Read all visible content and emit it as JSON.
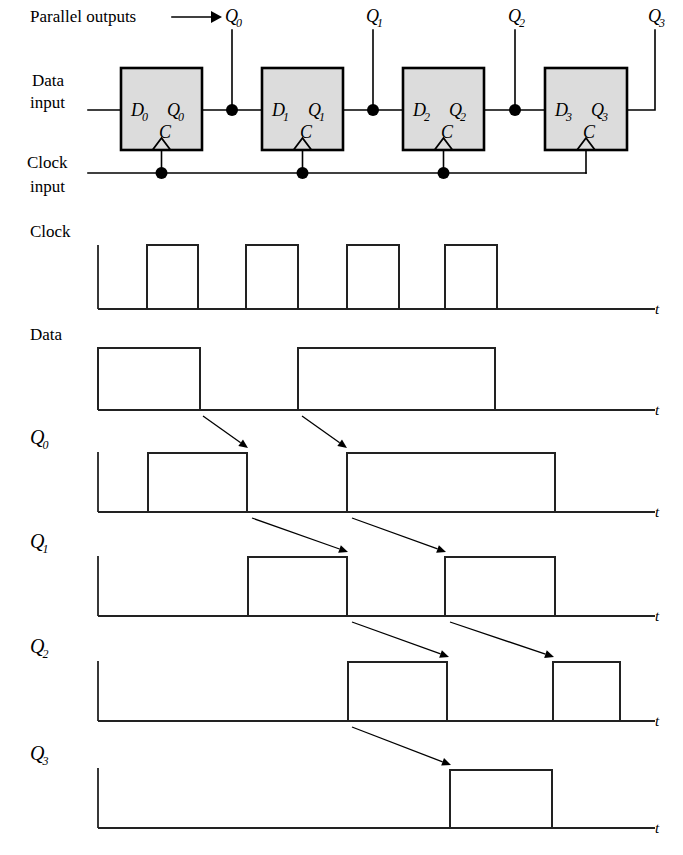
{
  "figure": {
    "background": "#ffffff",
    "ink": "#000000",
    "box_fill": "#dcdcdc"
  },
  "circuit": {
    "labels": {
      "parallel_outputs": "Parallel outputs",
      "data_input_line1": "Data",
      "data_input_line2": "input",
      "clock_input_line1": "Clock",
      "clock_input_line2": "input"
    },
    "arrow_marker": "→",
    "flipflops": [
      {
        "name": "flipflop-0",
        "x": 121,
        "y": 68,
        "w": 81,
        "h": 82,
        "d_label": "D",
        "d_sub": "0",
        "q_label": "Q",
        "q_sub": "0",
        "c_label": "C",
        "out_node_x": 232,
        "out_name": "Q",
        "out_sub": "0"
      },
      {
        "name": "flipflop-1",
        "x": 262,
        "y": 68,
        "w": 81,
        "h": 82,
        "d_label": "D",
        "d_sub": "1",
        "q_label": "Q",
        "q_sub": "1",
        "c_label": "C",
        "out_node_x": 373,
        "out_name": "Q",
        "out_sub": "1"
      },
      {
        "name": "flipflop-2",
        "x": 403,
        "y": 68,
        "w": 81,
        "h": 82,
        "d_label": "D",
        "d_sub": "2",
        "q_label": "Q",
        "q_sub": "2",
        "c_label": "C",
        "out_node_x": 515,
        "out_name": "Q",
        "out_sub": "2"
      },
      {
        "name": "flipflop-3",
        "x": 545,
        "y": 68,
        "w": 82,
        "h": 82,
        "d_label": "D",
        "d_sub": "3",
        "q_label": "Q",
        "q_sub": "3",
        "c_label": "C",
        "out_node_x": 655,
        "out_name": "Q",
        "out_sub": "3"
      }
    ],
    "output_tap_labels": [
      {
        "text": "Q",
        "sub": "0",
        "x": 225,
        "y": 22
      },
      {
        "text": "Q",
        "sub": "1",
        "x": 366,
        "y": 22
      },
      {
        "text": "Q",
        "sub": "2",
        "x": 508,
        "y": 22
      },
      {
        "text": "Q",
        "sub": "3",
        "x": 648,
        "y": 22
      }
    ],
    "data_line_y": 110,
    "clock_bus_y": 173,
    "clock_dots_x": [
      162,
      303,
      444
    ],
    "clock_stub_x": 586
  },
  "timing": {
    "axis_left_x": 98,
    "axis_right_x": 655,
    "t_label": "t",
    "waveforms": [
      {
        "name": "clock",
        "label": "Clock",
        "label_sub": "",
        "baseline_y": 309,
        "high_y": 245,
        "label_x": 30,
        "label_y": 237,
        "pulses": [
          [
            147,
            198
          ],
          [
            246,
            298
          ],
          [
            347,
            399
          ],
          [
            445,
            497
          ]
        ],
        "tail_to": 655
      },
      {
        "name": "data",
        "label": "Data",
        "label_sub": "",
        "baseline_y": 410,
        "high_y": 348,
        "label_x": 30,
        "label_y": 340,
        "pulses": [
          [
            98,
            200
          ],
          [
            298,
            495
          ]
        ],
        "tail_to": 655
      },
      {
        "name": "q0",
        "label": "Q",
        "label_sub": "0",
        "baseline_y": 512,
        "high_y": 453,
        "label_x": 30,
        "label_y": 444,
        "pulses": [
          [
            148,
            247
          ],
          [
            347,
            555
          ]
        ],
        "tail_to": 655
      },
      {
        "name": "q1",
        "label": "Q",
        "label_sub": "1",
        "baseline_y": 616,
        "high_y": 557,
        "label_x": 30,
        "label_y": 548,
        "pulses": [
          [
            248,
            347
          ],
          [
            445,
            555
          ]
        ],
        "tail_to": 655
      },
      {
        "name": "q2",
        "label": "Q",
        "label_sub": "2",
        "baseline_y": 721,
        "high_y": 662,
        "label_x": 30,
        "label_y": 653,
        "pulses": [
          [
            348,
            447
          ],
          [
            553,
            620
          ]
        ],
        "tail_to": 655
      },
      {
        "name": "q3",
        "label": "Q",
        "label_sub": "3",
        "baseline_y": 828,
        "high_y": 770,
        "label_x": 30,
        "label_y": 760,
        "pulses": [
          [
            450,
            552
          ]
        ],
        "tail_to": 655
      }
    ],
    "propagation_arrows": [
      {
        "name": "arrow-data-to-q0-a",
        "x1": 203,
        "y1": 416,
        "x2": 248,
        "y2": 448
      },
      {
        "name": "arrow-data-to-q0-b",
        "x1": 302,
        "y1": 416,
        "x2": 347,
        "y2": 448
      },
      {
        "name": "arrow-q0-to-q1-a",
        "x1": 252,
        "y1": 518,
        "x2": 348,
        "y2": 552
      },
      {
        "name": "arrow-q0-to-q1-b",
        "x1": 352,
        "y1": 518,
        "x2": 446,
        "y2": 552
      },
      {
        "name": "arrow-q1-to-q2-a",
        "x1": 352,
        "y1": 622,
        "x2": 449,
        "y2": 657
      },
      {
        "name": "arrow-q1-to-q2-b",
        "x1": 450,
        "y1": 622,
        "x2": 554,
        "y2": 657
      },
      {
        "name": "arrow-q2-to-q3",
        "x1": 352,
        "y1": 727,
        "x2": 451,
        "y2": 765
      }
    ]
  }
}
